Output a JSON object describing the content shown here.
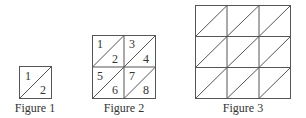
{
  "figures": [
    {
      "caption": "Figure 1",
      "grid": 1,
      "numbers": [
        "1",
        "2"
      ]
    },
    {
      "caption": "Figure 2",
      "grid": 2,
      "numbers": [
        "1",
        "2",
        "3",
        "4",
        "5",
        "6",
        "7",
        "8"
      ]
    },
    {
      "caption": "Figure 3",
      "grid": 3,
      "numbers": []
    }
  ],
  "colors": {
    "line": "#555555",
    "text": "#333333",
    "background": "#ffffff"
  }
}
